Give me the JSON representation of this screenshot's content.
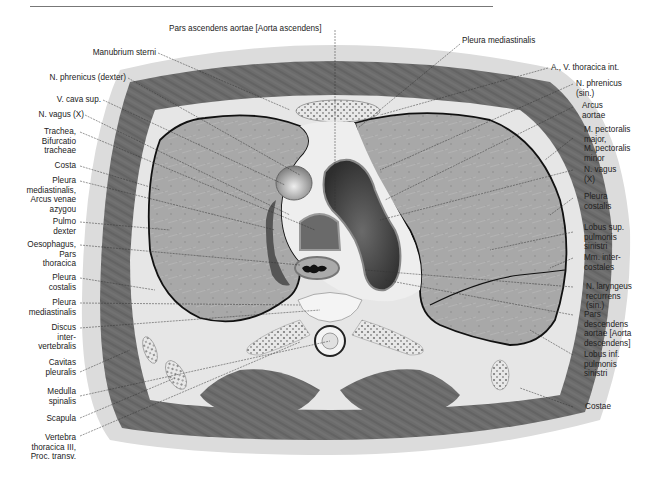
{
  "figure": {
    "type": "anatomical-cross-section",
    "colors": {
      "lung": "#a9a9a9",
      "muscle": "#6e6e6e",
      "fat": "#d8d8d8",
      "vessel_dark": "#3d3d3d",
      "outline": "#111111",
      "background": "#ffffff"
    }
  },
  "labels": {
    "top": [
      {
        "id": "pars-ascendens-aortae",
        "text": "Pars ascendens aortae [Aorta ascendens]"
      },
      {
        "id": "pleura-mediastinalis-top",
        "text": "Pleura mediastinalis"
      }
    ],
    "left": [
      {
        "id": "manubrium-sterni",
        "text": "Manubrium sterni"
      },
      {
        "id": "n-phrenicus-dexter",
        "text": "N. phrenicus (dexter)"
      },
      {
        "id": "v-cava-sup",
        "text": "V. cava sup."
      },
      {
        "id": "n-vagus-left",
        "text": "N. vagus (X)"
      },
      {
        "id": "trachea",
        "text": "Trachea,\nBifurcatio\ntracheae"
      },
      {
        "id": "costa",
        "text": "Costa"
      },
      {
        "id": "pleura-mediastinalis-arcus",
        "text": "Pleura\nmediastinalis,\nArcus venae\nazygou"
      },
      {
        "id": "pulmo-dexter",
        "text": "Pulmo\ndexter"
      },
      {
        "id": "oesophagus",
        "text": "Oesophagus,\nPars\nthoracica"
      },
      {
        "id": "pleura-costalis-left",
        "text": "Pleura\ncostalis"
      },
      {
        "id": "pleura-mediastinalis-left",
        "text": "Pleura\nmediastinalis"
      },
      {
        "id": "discus-intervertebralis",
        "text": "Discus\ninter-\nvertebralis"
      },
      {
        "id": "cavitas-pleuralis",
        "text": "Cavitas\npleuralis"
      },
      {
        "id": "medulla-spinalis",
        "text": "Medulla\nspinalis"
      },
      {
        "id": "scapula",
        "text": "Scapula"
      },
      {
        "id": "vertebra-thoracica",
        "text": "Vertebra\nthoracica III,\nProc. transv."
      }
    ],
    "right": [
      {
        "id": "a-v-thoracica-int",
        "text": "A., V. thoracica int."
      },
      {
        "id": "n-phrenicus-sin",
        "text": "N. phrenicus\n(sin.)"
      },
      {
        "id": "arcus-aortae",
        "text": "Arcus\naortae"
      },
      {
        "id": "m-pectoralis",
        "text": "M. pectoralis\nmajor,\nM. pectoralis\nminor"
      },
      {
        "id": "n-vagus-right",
        "text": "N. vagus\n(X)"
      },
      {
        "id": "pleura-costalis-right",
        "text": "Pleura\ncostalis"
      },
      {
        "id": "lobus-sup",
        "text": "Lobus sup.\npulmonis\nsinistri"
      },
      {
        "id": "mm-intercostales",
        "text": "Mm. inter-\ncostales"
      },
      {
        "id": "n-laryngeus",
        "text": "N. laryngeus\nrecurrens\n(sin.)"
      },
      {
        "id": "pars-descendens-aortae",
        "text": "Pars\ndescendens\naortae [Aorta\ndescendens]"
      },
      {
        "id": "lobus-inf",
        "text": "Lobus inf.\npulmonis\nsinistri"
      },
      {
        "id": "costae",
        "text": "Costae"
      }
    ]
  }
}
